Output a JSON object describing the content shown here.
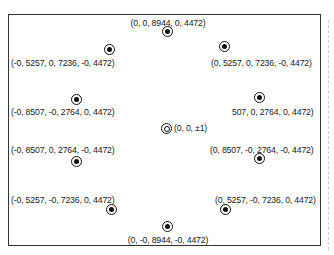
{
  "diagram": {
    "type": "icosahedron-vertex-projection",
    "center": {
      "label": "(0, 0, ±1)",
      "x": 166,
      "y": 128
    },
    "points": [
      {
        "id": "top",
        "label": "(0, 0, 8944, 0, 4472)",
        "mx": 167,
        "my": 31,
        "lx": 168,
        "ly": 18,
        "align": "center"
      },
      {
        "id": "upper-left",
        "label": "(-0, 5257, 0, 7236, -0, 4472)",
        "mx": 109,
        "my": 49,
        "lx": 11,
        "ly": 58,
        "align": "left"
      },
      {
        "id": "upper-right",
        "label": "(0, 5257, 0, 7236, -0, 4472)",
        "mx": 224,
        "my": 46,
        "lx": 211,
        "ly": 58,
        "align": "left"
      },
      {
        "id": "mid-left",
        "label": "(-0, 8507, -0, 2764, 0, 4472)",
        "mx": 76,
        "my": 99,
        "lx": 11,
        "ly": 107,
        "align": "left"
      },
      {
        "id": "mid-right",
        "label": "507, 0, 2764, 0, 4472)",
        "mx": 259,
        "my": 97,
        "lx": 232,
        "ly": 107,
        "align": "left"
      },
      {
        "id": "lower-left",
        "label": "(-0, 8507, 0, 2764, -0, 4472)",
        "mx": 76,
        "my": 161,
        "lx": 11,
        "ly": 145,
        "align": "left"
      },
      {
        "id": "lower-right",
        "label": "(0, 8507, -0, 2764, -0, 4472)",
        "mx": 259,
        "my": 158,
        "lx": 210,
        "ly": 145,
        "align": "left"
      },
      {
        "id": "bottom-left",
        "label": "(-0, 5257, -0, 7236, 0, 4472)",
        "mx": 111,
        "my": 209,
        "lx": 11,
        "ly": 195,
        "align": "left"
      },
      {
        "id": "bottom-right",
        "label": "(0, 5257, -0, 7236, 0, 4472)",
        "mx": 225,
        "my": 209,
        "lx": 215,
        "ly": 195,
        "align": "left"
      },
      {
        "id": "bottom",
        "label": "(0, -0, 8944, -0, 4472)",
        "mx": 167,
        "my": 226,
        "lx": 168,
        "ly": 235,
        "align": "center"
      }
    ]
  }
}
